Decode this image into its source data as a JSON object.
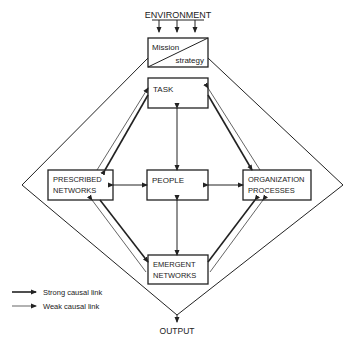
{
  "title_top": "ENVIRONMENT",
  "title_bottom": "OUTPUT",
  "boxes": {
    "mission": {
      "line1": "Mission",
      "line2": "strategy"
    },
    "task": {
      "line1": "TASK"
    },
    "prescribed": {
      "line1": "PRESCRIBED",
      "line2": "NETWORKS"
    },
    "people": {
      "line1": "PEOPLE"
    },
    "organization": {
      "line1": "ORGANIZATION",
      "line2": "PROCESSES"
    },
    "emergent": {
      "line1": "EMERGENT",
      "line2": "NETWORKS"
    }
  },
  "legend": {
    "strong": "Strong causal link",
    "weak": "Weak causal link"
  },
  "colors": {
    "ink": "#222222",
    "background": "#ffffff"
  }
}
